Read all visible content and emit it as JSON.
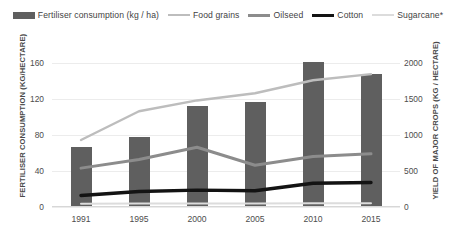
{
  "legend": {
    "items": [
      {
        "label": "Fertiliser consumption (kg / ha)",
        "icon": "bar-swatch",
        "color": "#5f5f5f"
      },
      {
        "label": "Food grains",
        "icon": "line-swatch",
        "color": "#bdbdbd"
      },
      {
        "label": "Oilseed",
        "icon": "line-swatch",
        "color": "#8c8c8c"
      },
      {
        "label": "Cotton",
        "icon": "line-swatch",
        "color": "#131313"
      },
      {
        "label": "Sugarcane*",
        "icon": "line-swatch",
        "color": "#dcdcdc"
      }
    ]
  },
  "axes": {
    "left_title": "FERTILISER CONSUMPTION (KG/HECTARE)",
    "right_title": "YIELD OF MAJOR CROPS (KG / HECTARE)",
    "left_ticks": [
      "160",
      "120",
      "80",
      "40",
      "0"
    ],
    "right_ticks": [
      "2000",
      "1500",
      "1000",
      "500",
      "0"
    ],
    "x_ticks": [
      "1991",
      "1995",
      "2000",
      "2005",
      "2010",
      "2015"
    ]
  },
  "chart_data": {
    "type": "bar",
    "title": "",
    "xlabel": "",
    "ylabel": "FERTILISER CONSUMPTION (KG/HECTARE)",
    "y2label": "YIELD OF MAJOR CROPS (KG / HECTARE)",
    "categories": [
      "1991",
      "1995",
      "2000",
      "2005",
      "2010",
      "2015"
    ],
    "ylim": [
      0,
      180
    ],
    "y2lim": [
      0,
      2250
    ],
    "yticks": [
      0,
      40,
      80,
      120,
      160
    ],
    "y2ticks": [
      0,
      500,
      1000,
      1500,
      2000
    ],
    "grid": true,
    "legend_position": "top",
    "series": [
      {
        "name": "Fertiliser consumption (kg / ha)",
        "type": "bar",
        "axis": "left",
        "color": "#5f5f5f",
        "values": [
          67,
          78,
          112,
          117,
          161,
          148
        ]
      },
      {
        "name": "Food grains",
        "type": "line",
        "axis": "right",
        "color": "#bdbdbd",
        "values": [
          930,
          1330,
          1480,
          1580,
          1760,
          1845
        ]
      },
      {
        "name": "Oilseed",
        "type": "line",
        "axis": "right",
        "color": "#8c8c8c",
        "values": [
          540,
          660,
          830,
          580,
          700,
          740
        ]
      },
      {
        "name": "Cotton",
        "type": "line",
        "axis": "right",
        "color": "#131313",
        "values": [
          160,
          215,
          235,
          225,
          330,
          340
        ]
      },
      {
        "name": "Sugarcane*",
        "type": "line",
        "axis": "right",
        "color": "#dcdcdc",
        "values": [
          45,
          48,
          50,
          48,
          52,
          52
        ]
      }
    ]
  }
}
